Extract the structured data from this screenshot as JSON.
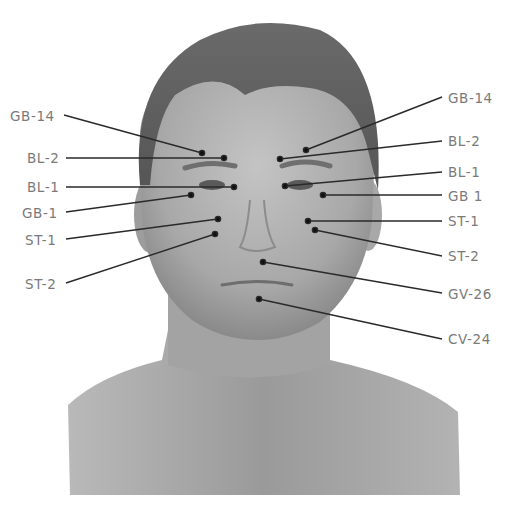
{
  "figure": {
    "background": "#ffffff",
    "skin_tone": "#a9a9a9",
    "hair_tone": "#5e5e5e",
    "label_color": "#7a7a7a",
    "line_color": "#2a2a2a"
  },
  "labels": {
    "left": [
      {
        "text": "GB-14",
        "x": 10,
        "y": 108,
        "line_start": [
          64,
          115
        ],
        "point": [
          202,
          153
        ]
      },
      {
        "text": "BL-2",
        "x": 27,
        "y": 150,
        "line_start": [
          66,
          158
        ],
        "point": [
          224,
          158
        ]
      },
      {
        "text": "BL-1",
        "x": 27,
        "y": 179,
        "line_start": [
          66,
          187
        ],
        "point": [
          234,
          187
        ]
      },
      {
        "text": "GB-1",
        "x": 22,
        "y": 207,
        "line_start": [
          66,
          212
        ],
        "point": [
          191,
          195
        ]
      },
      {
        "text": "ST-1",
        "x": 25,
        "y": 235,
        "line_start": [
          66,
          239
        ],
        "point": [
          218,
          219
        ]
      },
      {
        "text": "ST-2",
        "x": 25,
        "y": 277,
        "line_start": [
          66,
          283
        ],
        "point": [
          215,
          234
        ]
      }
    ],
    "right": [
      {
        "text": "GB-14",
        "x": 448,
        "y": 90,
        "line_start": [
          306,
          150
        ],
        "point": [
          306,
          150
        ],
        "line_end": [
          442,
          97
        ]
      },
      {
        "text": "BL-2",
        "x": 448,
        "y": 133,
        "line_start": [
          280,
          159
        ],
        "point": [
          280,
          159
        ],
        "line_end": [
          442,
          141
        ]
      },
      {
        "text": "BL-1",
        "x": 448,
        "y": 164,
        "line_start": [
          285,
          186
        ],
        "point": [
          285,
          186
        ],
        "line_end": [
          442,
          172
        ]
      },
      {
        "text": "GB 1",
        "x": 448,
        "y": 188,
        "line_start": [
          323,
          195
        ],
        "point": [
          323,
          195
        ],
        "line_end": [
          442,
          195
        ]
      },
      {
        "text": "ST-1",
        "x": 448,
        "y": 213,
        "line_start": [
          308,
          221
        ],
        "point": [
          308,
          221
        ],
        "line_end": [
          442,
          221
        ]
      },
      {
        "text": "ST-2",
        "x": 448,
        "y": 247,
        "line_start": [
          315,
          230
        ],
        "point": [
          315,
          230
        ],
        "line_end": [
          442,
          256
        ]
      },
      {
        "text": "GV-26",
        "x": 448,
        "y": 286,
        "line_start": [
          263,
          262
        ],
        "point": [
          263,
          262
        ],
        "line_end": [
          442,
          293
        ]
      },
      {
        "text": "CV-24",
        "x": 448,
        "y": 331,
        "line_start": [
          259,
          299
        ],
        "point": [
          259,
          299
        ],
        "line_end": [
          442,
          339
        ]
      }
    ]
  }
}
